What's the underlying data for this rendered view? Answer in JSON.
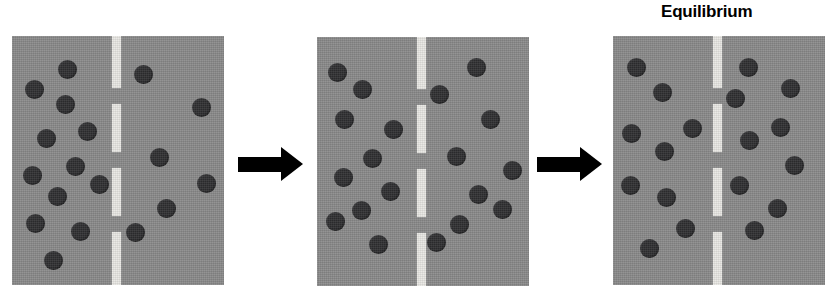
{
  "figure": {
    "type": "diffusion-equilibrium-diagram",
    "label": "Equilibrium",
    "colors": {
      "panel_background": "#8a8a8a",
      "particle": "#2f2f31",
      "membrane_dash": "#e9e8e4",
      "arrow": "#000000",
      "page_background": "#ffffff"
    },
    "panel_size": {
      "width": 212,
      "height": 249
    },
    "particle_diameter": 19,
    "membrane": {
      "width": 9,
      "dashes": [
        {
          "top": 0,
          "height": 52
        },
        {
          "top": 68,
          "height": 48
        },
        {
          "top": 132,
          "height": 48
        },
        {
          "top": 196,
          "height": 53
        }
      ]
    },
    "panels": [
      {
        "name": "panel-initial",
        "x": 12,
        "y": 36,
        "membrane_x": 100,
        "counts": {
          "left": 11,
          "right": 6
        },
        "left_particles": [
          {
            "x": 46,
            "y": 24
          },
          {
            "x": 13,
            "y": 44
          },
          {
            "x": 44,
            "y": 59
          },
          {
            "x": 25,
            "y": 93
          },
          {
            "x": 66,
            "y": 86
          },
          {
            "x": 54,
            "y": 121
          },
          {
            "x": 11,
            "y": 130
          },
          {
            "x": 36,
            "y": 151
          },
          {
            "x": 78,
            "y": 139
          },
          {
            "x": 14,
            "y": 178
          },
          {
            "x": 59,
            "y": 186
          },
          {
            "x": 32,
            "y": 215
          }
        ],
        "right_particles": [
          {
            "x": 122,
            "y": 29
          },
          {
            "x": 180,
            "y": 62
          },
          {
            "x": 138,
            "y": 112
          },
          {
            "x": 185,
            "y": 138
          },
          {
            "x": 145,
            "y": 163
          },
          {
            "x": 114,
            "y": 187
          }
        ]
      },
      {
        "name": "panel-diffusing",
        "x": 317,
        "y": 37,
        "membrane_x": 100,
        "counts": {
          "left": 10,
          "right": 9
        },
        "left_particles": [
          {
            "x": 11,
            "y": 26
          },
          {
            "x": 36,
            "y": 43
          },
          {
            "x": 18,
            "y": 73
          },
          {
            "x": 67,
            "y": 83
          },
          {
            "x": 46,
            "y": 112
          },
          {
            "x": 17,
            "y": 131
          },
          {
            "x": 64,
            "y": 145
          },
          {
            "x": 35,
            "y": 164
          },
          {
            "x": 9,
            "y": 175
          },
          {
            "x": 52,
            "y": 198
          }
        ],
        "right_particles": [
          {
            "x": 150,
            "y": 21
          },
          {
            "x": 113,
            "y": 48
          },
          {
            "x": 164,
            "y": 73
          },
          {
            "x": 130,
            "y": 110
          },
          {
            "x": 186,
            "y": 124
          },
          {
            "x": 152,
            "y": 148
          },
          {
            "x": 133,
            "y": 178
          },
          {
            "x": 110,
            "y": 196
          },
          {
            "x": 176,
            "y": 163
          }
        ]
      },
      {
        "name": "panel-equilibrium",
        "x": 613,
        "y": 36,
        "membrane_x": 100,
        "counts": {
          "left": 9,
          "right": 9
        },
        "left_particles": [
          {
            "x": 14,
            "y": 22
          },
          {
            "x": 40,
            "y": 47
          },
          {
            "x": 9,
            "y": 88
          },
          {
            "x": 70,
            "y": 83
          },
          {
            "x": 42,
            "y": 106
          },
          {
            "x": 8,
            "y": 140
          },
          {
            "x": 44,
            "y": 152
          },
          {
            "x": 63,
            "y": 183
          },
          {
            "x": 27,
            "y": 203
          }
        ],
        "right_particles": [
          {
            "x": 126,
            "y": 22
          },
          {
            "x": 168,
            "y": 43
          },
          {
            "x": 113,
            "y": 53
          },
          {
            "x": 158,
            "y": 82
          },
          {
            "x": 127,
            "y": 95
          },
          {
            "x": 172,
            "y": 120
          },
          {
            "x": 117,
            "y": 140
          },
          {
            "x": 155,
            "y": 163
          },
          {
            "x": 132,
            "y": 185
          }
        ]
      }
    ],
    "arrows": [
      {
        "name": "arrow-1",
        "x": 238,
        "y": 147,
        "shaft_width": 44,
        "shaft_height": 15
      },
      {
        "name": "arrow-2",
        "x": 537,
        "y": 147,
        "shaft_width": 44,
        "shaft_height": 15
      }
    ],
    "label_position": {
      "x": 661,
      "y": 2,
      "font_size": 17
    }
  }
}
